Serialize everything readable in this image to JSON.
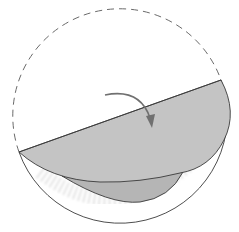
{
  "diagram": {
    "type": "folding-instruction",
    "colors": {
      "background": "#ffffff",
      "outline": "#3a3a3a",
      "dashed_outline": "#6a6a6a",
      "flap_fill": "#c4c4c4",
      "under_flap_fill": "#b8b8b8",
      "arrow": "#707070",
      "hatch": "#e2e2e2"
    },
    "elements": [
      {
        "name": "dashed-original-circle",
        "style": "dashed"
      },
      {
        "name": "fold-line",
        "from": [
          19,
          152
        ],
        "to": [
          221,
          80
        ]
      },
      {
        "name": "folded-flap",
        "fill": "gray"
      },
      {
        "name": "under-layer",
        "fill": "gray"
      },
      {
        "name": "outer-circle-bottom",
        "style": "solid"
      },
      {
        "name": "fold-direction-arrow",
        "icon": "curved-arrow-down-right"
      }
    ]
  }
}
